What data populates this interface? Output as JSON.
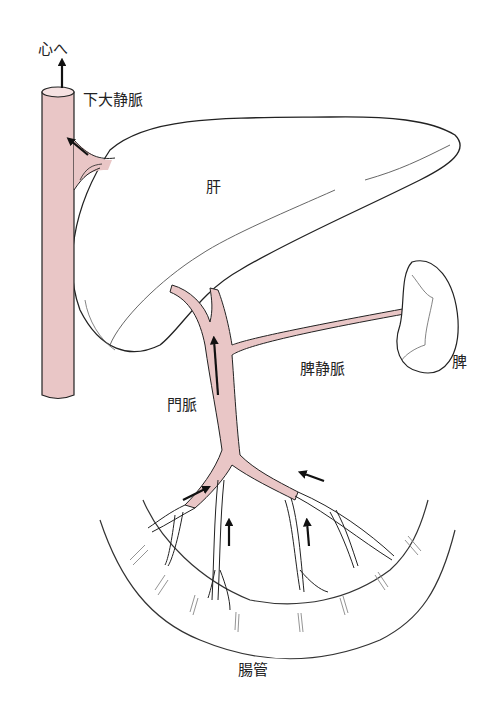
{
  "diagram": {
    "type": "anatomy",
    "colors": {
      "vessel_fill": "#e9c6c6",
      "outline": "#222222",
      "background": "#ffffff"
    },
    "labels": {
      "to_heart": "心へ",
      "inferior_vena_cava": "下大静脈",
      "liver": "肝",
      "splenic_vein": "脾静脈",
      "spleen": "脾",
      "portal_vein": "門脈",
      "intestine": "腸管"
    },
    "arrows": [
      {
        "name": "arrow-to-heart",
        "direction": "up"
      },
      {
        "name": "arrow-hepatic-vein",
        "direction": "up-left"
      },
      {
        "name": "arrow-portal-vein",
        "direction": "up"
      },
      {
        "name": "arrow-mesenteric-left",
        "direction": "up-right"
      },
      {
        "name": "arrow-mesenteric-center-left",
        "direction": "up"
      },
      {
        "name": "arrow-mesenteric-center-right",
        "direction": "up"
      },
      {
        "name": "arrow-mesenteric-right",
        "direction": "up-left"
      }
    ]
  }
}
